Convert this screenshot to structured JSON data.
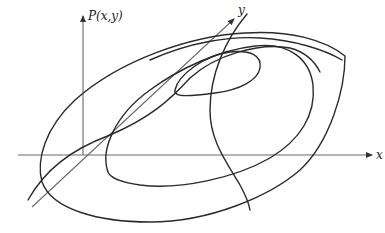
{
  "figure": {
    "axes": {
      "vertical_label": "P(x,y)",
      "x_label": "x",
      "y_label": "y"
    },
    "colors": {
      "curve": "#2a2a2a",
      "axis": "#6a6a6a",
      "background": "#ffffff"
    }
  }
}
